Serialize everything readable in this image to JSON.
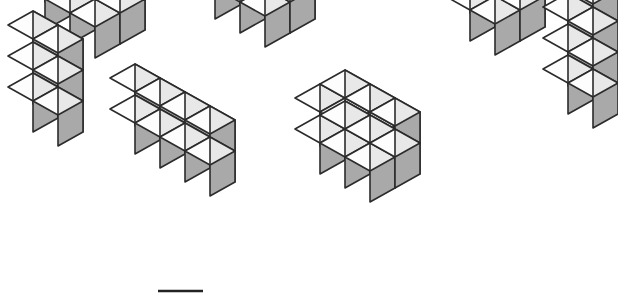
{
  "page": {
    "background_color": "#ffffff",
    "width": 618,
    "height": 299
  },
  "style": {
    "top_face_color": "#fdfdfd",
    "left_face_color": "#e8e8e8",
    "right_face_color": "#a9a9a9",
    "edge_color": "#2b2b2b",
    "edge_width": 1.6,
    "cube_half_width": 25,
    "cube_half_depth": 14,
    "cube_height": 31
  },
  "figures": [
    {
      "id": "figure-1",
      "name": "flat-slab-3x2x1",
      "label": "3 x 2 x 1 flat slab",
      "cube_count": 6,
      "dimensions": {
        "x": 3,
        "y": 2,
        "z": 1
      },
      "origin": {
        "x": 20,
        "y": 16
      }
    },
    {
      "id": "figure-2",
      "name": "block-3x2x2",
      "label": "3 x 2 x 2 block",
      "cube_count": 12,
      "dimensions": {
        "x": 3,
        "y": 2,
        "z": 2
      },
      "origin": {
        "x": 190,
        "y": 5
      }
    },
    {
      "id": "figure-3",
      "name": "tower-2x2x3",
      "label": "2 x 2 x 3 tower",
      "cube_count": 12,
      "dimensions": {
        "x": 2,
        "y": 2,
        "z": 3
      },
      "origin": {
        "x": 445,
        "y": 27
      }
    },
    {
      "id": "figure-4",
      "name": "tower-2x1x3",
      "label": "2 x 1 x 3 tower",
      "cube_count": 6,
      "dimensions": {
        "x": 2,
        "y": 1,
        "z": 3
      },
      "origin": {
        "x": 8,
        "y": 118
      }
    },
    {
      "id": "figure-5",
      "name": "wall-4x1x2",
      "label": "4 x 1 x 2 wall",
      "cube_count": 8,
      "dimensions": {
        "x": 4,
        "y": 1,
        "z": 2
      },
      "origin": {
        "x": 110,
        "y": 140
      }
    },
    {
      "id": "figure-6",
      "name": "block-3x2x2-lower",
      "label": "3 x 2 x 2 block",
      "cube_count": 12,
      "dimensions": {
        "x": 3,
        "y": 2,
        "z": 2
      },
      "origin": {
        "x": 295,
        "y": 160
      }
    },
    {
      "id": "figure-7",
      "name": "tower-2x1x4",
      "label": "2 x 1 x 4 tower",
      "cube_count": 8,
      "dimensions": {
        "x": 2,
        "y": 1,
        "z": 4
      },
      "origin": {
        "x": 543,
        "y": 100
      }
    }
  ],
  "baseline_mark": {
    "name": "baseline-mark",
    "x1": 158,
    "y1": 291,
    "x2": 203,
    "y2": 291,
    "color": "#232323",
    "width": 2.4
  }
}
